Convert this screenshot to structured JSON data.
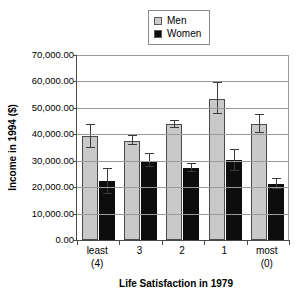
{
  "chart_data": {
    "type": "bar",
    "title": "",
    "xlabel": "Life Satisfaction in 1979",
    "ylabel": "Income in 1994 ($)",
    "categories": [
      "least\n(4)",
      "3",
      "2",
      "1",
      "most\n(0)"
    ],
    "category_lines": [
      {
        "line1": "least",
        "line2": "(4)"
      },
      {
        "line1": "3",
        "line2": ""
      },
      {
        "line1": "2",
        "line2": ""
      },
      {
        "line1": "1",
        "line2": ""
      },
      {
        "line1": "most",
        "line2": "(0)"
      }
    ],
    "series": [
      {
        "name": "Men",
        "color": "#c9c9c9",
        "values": [
          39300,
          37500,
          43800,
          53500,
          44000
        ],
        "err_upper": [
          43600,
          39200,
          45100,
          59500,
          47400
        ],
        "err_lower": [
          35000,
          35800,
          42500,
          47500,
          40600
        ]
      },
      {
        "name": "Women",
        "color": "#0d0d0d",
        "values": [
          22200,
          30000,
          27200,
          30200,
          21200
        ],
        "err_upper": [
          26800,
          32400,
          28600,
          34100,
          23000
        ],
        "err_lower": [
          17600,
          27600,
          25800,
          26300,
          19400
        ]
      }
    ],
    "ylim": [
      0,
      70000
    ],
    "ytick_values": [
      0,
      10000,
      20000,
      30000,
      40000,
      50000,
      60000,
      70000
    ],
    "ytick_labels": [
      "0.00",
      "10,000.00",
      "20,000.00",
      "30,000.00",
      "40,000.00",
      "50,000.00",
      "60,000.00",
      "70,000.00"
    ],
    "grid": true,
    "legend_position": "top-center",
    "legend": [
      "Men",
      "Women"
    ]
  },
  "legend": {
    "items": [
      {
        "label": "Men",
        "color": "#c9c9c9"
      },
      {
        "label": "Women",
        "color": "#0d0d0d"
      }
    ]
  },
  "axes": {
    "y_title": "Income in 1994 ($)",
    "x_title": "Life Satisfaction in 1979"
  }
}
